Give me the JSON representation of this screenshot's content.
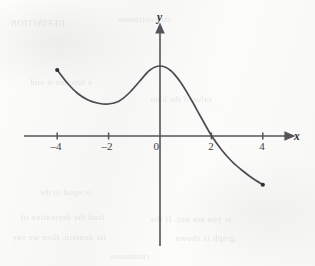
{
  "figure": {
    "width": 315,
    "height": 266,
    "background_color": "#fbfbfa",
    "ink_color": "#4c4b51",
    "axis_color": "#55545a",
    "ghost_text": [
      {
        "text": "DEFINITION",
        "x": 10,
        "y": 18,
        "size": 9
      },
      {
        "text": "the continuous",
        "x": 118,
        "y": 15,
        "size": 8
      },
      {
        "text": "a function is said",
        "x": 30,
        "y": 78,
        "size": 8
      },
      {
        "text": "value of the limit",
        "x": 150,
        "y": 95,
        "size": 8
      },
      {
        "text": "is equal to the",
        "x": 40,
        "y": 188,
        "size": 8
      },
      {
        "text": "find the derivative of",
        "x": 20,
        "y": 212,
        "size": 9
      },
      {
        "text": "is you are not. If the",
        "x": 150,
        "y": 214,
        "size": 9
      },
      {
        "text": "its domain, then we say",
        "x": 12,
        "y": 232,
        "size": 9
      },
      {
        "text": "graph is shown",
        "x": 175,
        "y": 233,
        "size": 9
      },
      {
        "text": "continuous",
        "x": 110,
        "y": 252,
        "size": 8
      }
    ]
  },
  "chart_data": {
    "type": "line",
    "title": "",
    "xlabel": "x",
    "ylabel": "y",
    "xlim": [
      -5.3,
      5.1
    ],
    "ylim": [
      -3.7,
      4.2
    ],
    "grid": false,
    "legend": null,
    "x_ticks": [
      -4,
      -2,
      0,
      2,
      4
    ],
    "x_tick_labels": [
      "–4",
      "–2",
      "0",
      "2",
      "4"
    ],
    "y_ticks": [],
    "y_tick_labels": [],
    "origin_label": "0",
    "axis_arrows": {
      "x_positive": true,
      "y_positive": true
    },
    "series": [
      {
        "name": "curve",
        "domain": [
          -4,
          4
        ],
        "endpoints_marked": true,
        "x": [
          -4.0,
          -3.6,
          -3.2,
          -2.8,
          -2.4,
          -2.0,
          -1.6,
          -1.2,
          -0.8,
          -0.4,
          0.0,
          0.4,
          0.8,
          1.2,
          1.6,
          2.0,
          2.4,
          2.8,
          3.2,
          3.6,
          4.0
        ],
        "y": [
          2.64,
          2.11,
          1.7,
          1.44,
          1.31,
          1.28,
          1.39,
          1.72,
          2.18,
          2.63,
          2.8,
          2.63,
          2.15,
          1.48,
          0.74,
          0.02,
          -0.56,
          -1.02,
          -1.38,
          -1.69,
          -1.95
        ]
      }
    ],
    "annotations": [
      {
        "kind": "endpoint-dot",
        "x": -4.0,
        "y": 2.64
      },
      {
        "kind": "endpoint-dot",
        "x": 4.0,
        "y": -1.95
      },
      {
        "kind": "local-minimum",
        "x": -2.0,
        "y": 1.28
      },
      {
        "kind": "local-maximum",
        "x": 0.0,
        "y": 2.8
      },
      {
        "kind": "x-intercept",
        "x": 2.0,
        "y": 0.0
      }
    ]
  },
  "labels": {
    "x_axis_name": "x",
    "y_axis_name": "y",
    "tick_neg4": "–4",
    "tick_neg2": "–2",
    "tick_zero": "0",
    "tick_pos2": "2",
    "tick_pos4": "4"
  }
}
